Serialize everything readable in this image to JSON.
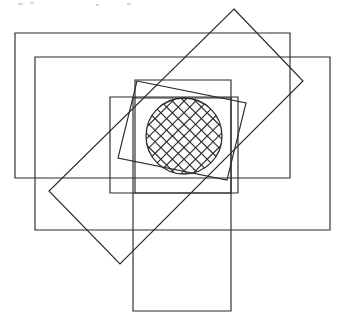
{
  "figure": {
    "canvas": {
      "width": 339,
      "height": 328,
      "background": "#ffffff"
    },
    "stroke_color": "#2b2b2b",
    "stroke_width": 1.15,
    "shape_count": 8
  },
  "shapes": [
    {
      "id": "rect-outer-upper-left",
      "name": "Outer upper-left rectangle",
      "type": "rectangle",
      "rotation_deg": 0,
      "x": 15,
      "y": 33,
      "width": 275,
      "height": 145,
      "points": "15,33 290,33 290,178 15,178"
    },
    {
      "id": "rect-outer-lower-right",
      "name": "Outer lower-right rectangle",
      "type": "rectangle",
      "rotation_deg": 0,
      "x": 35,
      "y": 57,
      "width": 295,
      "height": 173,
      "points": "35,57 330,57 330,230 35,230"
    },
    {
      "id": "rect-middle-upper",
      "name": "Middle upper rectangle",
      "type": "rectangle",
      "rotation_deg": 0,
      "x": 135,
      "y": 80,
      "width": 96,
      "height": 113,
      "points": "135,80 231,80 231,193 135,193"
    },
    {
      "id": "rect-middle-lower",
      "name": "Middle lower rectangle",
      "type": "rectangle",
      "rotation_deg": 0,
      "x": 110,
      "y": 97,
      "width": 128,
      "height": 96,
      "points": "110,97 238,97 238,193 110,193"
    },
    {
      "id": "rect-tall-vertical",
      "name": "Tall vertical rectangle",
      "type": "rectangle",
      "rotation_deg": 0,
      "x": 133,
      "y": 98,
      "width": 98,
      "height": 213,
      "points": "133,98 231,98 231,311 133,311"
    },
    {
      "id": "rect-rotated-diamond",
      "name": "Large rotated rectangle (diamond orientation)",
      "type": "rectangle",
      "rotation_deg": -45,
      "points": "234,9 303,81 120,264 49,191"
    },
    {
      "id": "rect-tilted-small",
      "name": "Small tilted rectangle around circle",
      "type": "rectangle",
      "rotation_deg": 11,
      "points": "137,81 246,103 227,180 118,158"
    },
    {
      "id": "circle-hatched",
      "name": "Cross-hatched circle",
      "type": "circle",
      "cx": 184,
      "cy": 136,
      "r": 38,
      "fill_pattern": "cross-hatch",
      "hatch_angle_deg": 45,
      "hatch_spacing_px": 8
    }
  ],
  "hatch": {
    "pattern_name": "diagonal-cross-hatch",
    "angle_deg": 45,
    "spacing_px": 8.2,
    "line_color": "#2b2b2b",
    "line_width": 1.15
  },
  "artifacts": {
    "description": "Faint scanner specks along the top edge of the page",
    "specks": [
      {
        "x": 18,
        "y": 3,
        "w": 5,
        "h": 2
      },
      {
        "x": 30,
        "y": 2,
        "w": 4,
        "h": 2
      },
      {
        "x": 96,
        "y": 4,
        "w": 3,
        "h": 2
      },
      {
        "x": 127,
        "y": 3,
        "w": 4,
        "h": 2
      }
    ]
  }
}
